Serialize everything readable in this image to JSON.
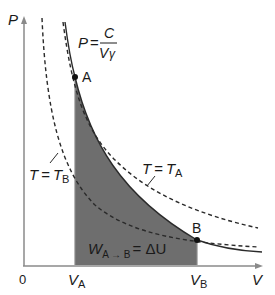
{
  "diagram": {
    "axes": {
      "y_label": "P",
      "x_label": "V",
      "origin_label": "0"
    },
    "ticks": {
      "va": {
        "main": "V",
        "sub": "A"
      },
      "vb": {
        "main": "V",
        "sub": "B"
      }
    },
    "points": {
      "a": "A",
      "b": "B"
    },
    "formula": {
      "lhs": "P",
      "eq": "=",
      "numerator": "C",
      "denominator": "V",
      "exponent": "γ"
    },
    "isotherms": {
      "ta": {
        "lhs": "T",
        "eq": "=",
        "rhs": "T",
        "sub": "A"
      },
      "tb": {
        "lhs": "T",
        "eq": "=",
        "rhs": "T",
        "sub": "B"
      }
    },
    "work_label": {
      "w": "W",
      "sub": "A → B",
      "eq": "= ΔU"
    },
    "colors": {
      "axis": "#8a8a8a",
      "curve": "#2a2a2a",
      "fill": "#6e6e6e",
      "point": "#111111"
    }
  }
}
